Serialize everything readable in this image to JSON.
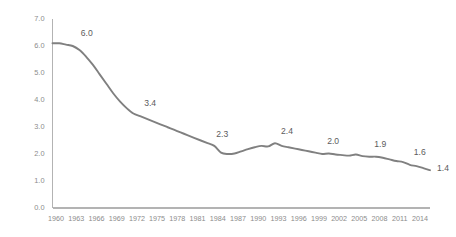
{
  "chart_data": {
    "type": "line",
    "title": "",
    "subtitle": "",
    "xlabel": "",
    "ylabel": "",
    "xlim": [
      1960,
      2016
    ],
    "ylim": [
      0.0,
      7.0
    ],
    "grid": false,
    "legend": null,
    "legend_position": "none",
    "line_color": "#808080",
    "axis_color": "#b3b3b3",
    "tick_label_color": "#8c8c8c",
    "data_label_color": "#5c5c5c",
    "ytick_labels": [
      "0.0",
      "1.0",
      "2.0",
      "3.0",
      "4.0",
      "5.0",
      "6.0",
      "7.0"
    ],
    "ytick_values": [
      0,
      1,
      2,
      3,
      4,
      5,
      6,
      7
    ],
    "xtick_labels": [
      "1960",
      "1963",
      "1966",
      "1969",
      "1972",
      "1975",
      "1978",
      "1981",
      "1984",
      "1987",
      "1990",
      "1993",
      "1996",
      "1999",
      "2002",
      "2005",
      "2008",
      "2011",
      "2014"
    ],
    "xtick_values": [
      1960,
      1963,
      1966,
      1969,
      1972,
      1975,
      1978,
      1981,
      1984,
      1987,
      1990,
      1993,
      1996,
      1999,
      2002,
      2005,
      2008,
      2011,
      2014
    ],
    "x": [
      1960,
      1961,
      1962,
      1963,
      1964,
      1965,
      1966,
      1967,
      1968,
      1969,
      1970,
      1971,
      1972,
      1973,
      1974,
      1975,
      1976,
      1977,
      1978,
      1979,
      1980,
      1981,
      1982,
      1983,
      1984,
      1985,
      1986,
      1987,
      1988,
      1989,
      1990,
      1991,
      1992,
      1993,
      1994,
      1995,
      1996,
      1997,
      1998,
      1999,
      2000,
      2001,
      2002,
      2003,
      2004,
      2005,
      2006,
      2007,
      2008,
      2009,
      2010,
      2011,
      2012,
      2013,
      2014,
      2015,
      2016
    ],
    "y": [
      6.1,
      6.1,
      6.05,
      6.0,
      5.85,
      5.6,
      5.3,
      4.95,
      4.6,
      4.25,
      3.95,
      3.7,
      3.5,
      3.4,
      3.3,
      3.2,
      3.1,
      3.0,
      2.9,
      2.8,
      2.7,
      2.6,
      2.5,
      2.4,
      2.3,
      2.05,
      2.0,
      2.02,
      2.1,
      2.18,
      2.25,
      2.3,
      2.28,
      2.4,
      2.3,
      2.25,
      2.2,
      2.15,
      2.1,
      2.05,
      2.0,
      2.02,
      1.98,
      1.96,
      1.94,
      1.98,
      1.92,
      1.9,
      1.9,
      1.86,
      1.8,
      1.74,
      1.7,
      1.6,
      1.55,
      1.48,
      1.4
    ],
    "series": [
      {
        "name": "rate",
        "values": [
          6.1,
          6.1,
          6.05,
          6.0,
          5.85,
          5.6,
          5.3,
          4.95,
          4.6,
          4.25,
          3.95,
          3.7,
          3.5,
          3.4,
          3.3,
          3.2,
          3.1,
          3.0,
          2.9,
          2.8,
          2.7,
          2.6,
          2.5,
          2.4,
          2.3,
          2.05,
          2.0,
          2.02,
          2.1,
          2.18,
          2.25,
          2.3,
          2.28,
          2.4,
          2.3,
          2.25,
          2.2,
          2.15,
          2.1,
          2.05,
          2.0,
          2.02,
          1.98,
          1.96,
          1.94,
          1.98,
          1.92,
          1.9,
          1.9,
          1.86,
          1.8,
          1.74,
          1.7,
          1.6,
          1.55,
          1.48,
          1.4
        ]
      }
    ],
    "annotations": [
      {
        "text": "6.0",
        "x": 1963,
        "y": 6.0,
        "dx": 14,
        "dy": -10
      },
      {
        "text": "3.4",
        "x": 1973,
        "y": 3.4,
        "dx": 10,
        "dy": -10
      },
      {
        "text": "2.3",
        "x": 1984,
        "y": 2.3,
        "dx": 8,
        "dy": -9
      },
      {
        "text": "2.4",
        "x": 1993,
        "y": 2.4,
        "dx": 12,
        "dy": -9
      },
      {
        "text": "2.0",
        "x": 2000,
        "y": 2.0,
        "dx": 11,
        "dy": -10
      },
      {
        "text": "1.9",
        "x": 2007,
        "y": 1.9,
        "dx": 11,
        "dy": -10
      },
      {
        "text": "1.6",
        "x": 2013,
        "y": 1.6,
        "dx": 10,
        "dy": -10
      },
      {
        "text": "1.4",
        "x": 2016,
        "y": 1.4,
        "dx": 13,
        "dy": 1
      }
    ]
  }
}
